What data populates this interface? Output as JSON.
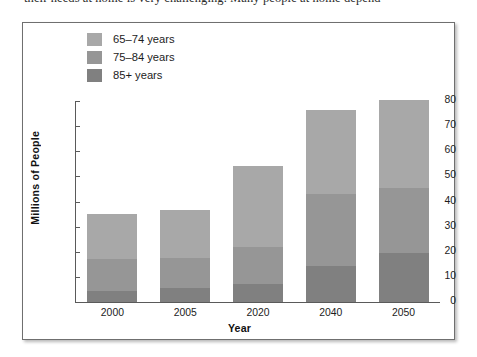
{
  "page": {
    "text_sliver": "their needs at home is very challenging. Many people at home depend"
  },
  "figure": {
    "legend": {
      "items": [
        {
          "label": "65–74 years",
          "color": "#a8a8a8",
          "swatch_name": "legend-swatch-65-74"
        },
        {
          "label": "75–84 years",
          "color": "#969696",
          "swatch_name": "legend-swatch-75-84"
        },
        {
          "label": "85+ years",
          "color": "#808080",
          "swatch_name": "legend-swatch-85-plus"
        }
      ]
    }
  },
  "chart_data": {
    "type": "bar",
    "stacked": true,
    "title": "",
    "xlabel": "Year",
    "ylabel": "Millions of People",
    "categories": [
      "2000",
      "2005",
      "2020",
      "2040",
      "2050"
    ],
    "yticks": [
      0,
      10,
      20,
      30,
      40,
      50,
      60,
      70,
      80
    ],
    "ylim": [
      0,
      80
    ],
    "grid": false,
    "legend_position": "top-left",
    "series": [
      {
        "name": "85+ years",
        "color": "#808080",
        "values": [
          4.5,
          5.5,
          7.0,
          14.5,
          19.5
        ]
      },
      {
        "name": "75–84 years",
        "color": "#969696",
        "values": [
          12.5,
          12.0,
          15.0,
          28.5,
          26.0
        ]
      },
      {
        "name": "65–74 years",
        "color": "#a8a8a8",
        "values": [
          18.0,
          19.0,
          32.0,
          33.5,
          35.0
        ]
      }
    ],
    "totals": [
      35.0,
      36.5,
      54.0,
      76.5,
      80.5
    ]
  }
}
